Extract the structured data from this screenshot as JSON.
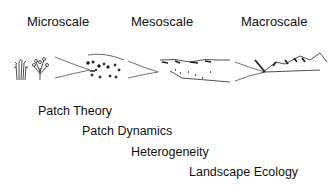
{
  "scales": [
    {
      "label": "Microscale"
    },
    {
      "label": "Mesoscale"
    },
    {
      "label": "Macroscale"
    }
  ],
  "concepts": [
    {
      "label": "Patch Theory"
    },
    {
      "label": "Patch Dynamics"
    },
    {
      "label": "Heterogeneity"
    },
    {
      "label": "Landscape Ecology"
    }
  ]
}
